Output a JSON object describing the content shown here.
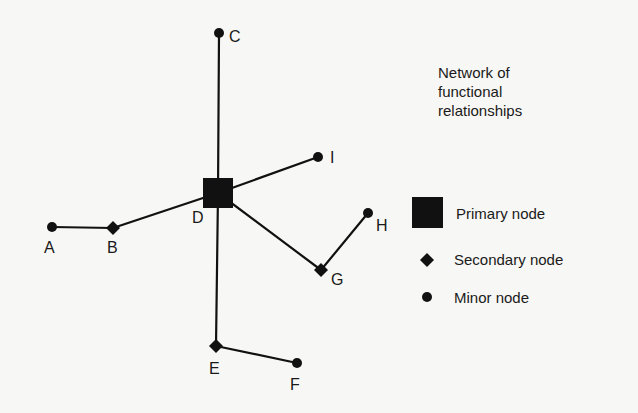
{
  "title": {
    "lines": [
      "Network of",
      "functional",
      "relationships"
    ]
  },
  "legend": {
    "primary": "Primary node",
    "secondary": "Secondary node",
    "minor": "Minor node"
  },
  "colors": {
    "ink": "#111111",
    "background": "#f7f7f5"
  },
  "nodes": [
    {
      "id": "A",
      "type": "minor",
      "x": 52,
      "y": 227
    },
    {
      "id": "B",
      "type": "secondary",
      "x": 113,
      "y": 228
    },
    {
      "id": "C",
      "type": "minor",
      "x": 219,
      "y": 33
    },
    {
      "id": "D",
      "type": "primary",
      "x": 218,
      "y": 193
    },
    {
      "id": "E",
      "type": "secondary",
      "x": 216,
      "y": 346
    },
    {
      "id": "F",
      "type": "minor",
      "x": 297,
      "y": 363
    },
    {
      "id": "G",
      "type": "secondary",
      "x": 321,
      "y": 270
    },
    {
      "id": "H",
      "type": "minor",
      "x": 368,
      "y": 213
    },
    {
      "id": "I",
      "type": "minor",
      "x": 318,
      "y": 157
    }
  ],
  "edges": [
    [
      "A",
      "B"
    ],
    [
      "B",
      "D"
    ],
    [
      "C",
      "D"
    ],
    [
      "D",
      "I"
    ],
    [
      "D",
      "E"
    ],
    [
      "E",
      "F"
    ],
    [
      "D",
      "G"
    ],
    [
      "G",
      "H"
    ]
  ],
  "labels": {
    "A": "A",
    "B": "B",
    "C": "C",
    "D": "D",
    "E": "E",
    "F": "F",
    "G": "G",
    "H": "H",
    "I": "I"
  }
}
